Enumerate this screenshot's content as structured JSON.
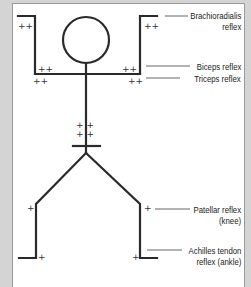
{
  "diagram": {
    "title": "",
    "colors": {
      "line": "#2a2a2a",
      "background": "#ffffff",
      "frame": "#d4d4d4",
      "leader": "#555555"
    },
    "grades": {
      "brachioradialis_left": "++",
      "brachioradialis_right": "++",
      "biceps_left": "++",
      "biceps_right": "++",
      "triceps_left": "++",
      "triceps_right": "++",
      "abdominal_upper": "+ +",
      "abdominal_lower": "+ +",
      "patellar_left": "+",
      "patellar_right": "+",
      "achilles_left": "+",
      "achilles_right": "+"
    },
    "labels": [
      {
        "id": "brachioradialis",
        "line1": "Brachioradialis",
        "line2": "reflex"
      },
      {
        "id": "biceps",
        "line1": "Biceps reflex"
      },
      {
        "id": "triceps",
        "line1": "Triceps reflex"
      },
      {
        "id": "patellar",
        "line1": "Patellar reflex",
        "line2": "(knee)"
      },
      {
        "id": "achilles",
        "line1": "Achilles tendon",
        "line2": "reflex (ankle)"
      }
    ]
  }
}
